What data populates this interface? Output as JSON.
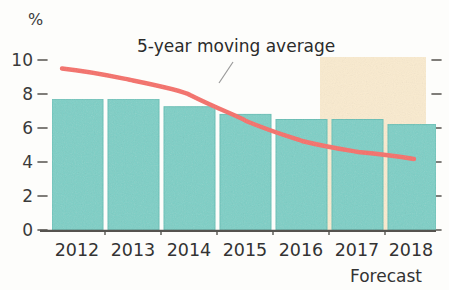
{
  "chart_data": {
    "type": "bar",
    "title": "",
    "subtitle": "",
    "xlabel": "",
    "ylabel": "%",
    "unit_label": "%",
    "categories": [
      "2012",
      "2013",
      "2014",
      "2015",
      "2016",
      "2017",
      "2018"
    ],
    "ylim": [
      0,
      10
    ],
    "yticks": [
      "0",
      "2",
      "4",
      "6",
      "8",
      "10"
    ],
    "ytick_values": [
      0,
      2,
      4,
      6,
      8,
      10
    ],
    "grid": false,
    "legend_position": "inline-annotation",
    "series": [
      {
        "name": "Annual value",
        "type": "bar",
        "color": "#7ccfc6",
        "edge_color": "#5ab8ae",
        "values": [
          7.7,
          7.7,
          7.25,
          6.8,
          6.5,
          6.5,
          6.2
        ]
      },
      {
        "name": "5-year moving average",
        "type": "line",
        "color": "#f4706a",
        "values": [
          9.5,
          9.0,
          8.4,
          7.7,
          7.0,
          6.75,
          6.65
        ]
      }
    ],
    "annotations": [
      {
        "text": "5-year moving average",
        "target_series": "5-year moving average"
      },
      {
        "text": "Forecast",
        "region_start_category": "2017",
        "region_end_category": "2018"
      }
    ],
    "shaded_regions": [
      {
        "label": "Forecast",
        "color": "#faebcf",
        "start_category": "2017",
        "end_category": "2018"
      }
    ]
  },
  "labels": {
    "unit": "%",
    "moving_average": "5-year moving average",
    "forecast": "Forecast",
    "y0": "0",
    "y2": "2",
    "y4": "4",
    "y6": "6",
    "y8": "8",
    "y10": "10",
    "x0": "2012",
    "x1": "2013",
    "x2": "2014",
    "x3": "2015",
    "x4": "2016",
    "x5": "2017",
    "x6": "2018"
  },
  "colors": {
    "bar": "#7ccfc6",
    "bar_edge": "#5fbdb3",
    "line": "#f4706a",
    "forecast_band": "#faebcf",
    "axis": "#4a4a48",
    "text": "#333333",
    "background": "#fdfdfb"
  }
}
